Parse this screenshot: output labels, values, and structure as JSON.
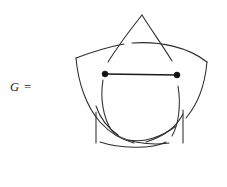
{
  "figure": {
    "label": "G =",
    "caption_text": "G =",
    "background_color": "#ffffff",
    "stroke_color": "#2b2b2b",
    "vertex_color": "#111111",
    "edge_color": "#1a1a1a",
    "width": 227,
    "height": 187
  },
  "diagram": {
    "type": "knot-graph",
    "star_points": [
      {
        "name": "top",
        "x": 142,
        "y": 15
      },
      {
        "name": "right",
        "x": 207,
        "y": 62
      },
      {
        "name": "bottom-right",
        "x": 183,
        "y": 143
      },
      {
        "name": "bottom-left",
        "x": 96,
        "y": 143
      },
      {
        "name": "left",
        "x": 76,
        "y": 58
      }
    ],
    "vertices": [
      {
        "id": "v1",
        "label": "",
        "x": 105,
        "y": 74
      },
      {
        "id": "v2",
        "label": "",
        "x": 177,
        "y": 75
      }
    ],
    "edges": [
      {
        "id": "e1",
        "from": "v1",
        "to": "v2",
        "style": "straight"
      }
    ],
    "strands": [
      {
        "id": "s1",
        "from": "top",
        "to": "bottom-right"
      },
      {
        "id": "s2",
        "from": "right",
        "to": "bottom-left"
      },
      {
        "id": "s3",
        "from": "bottom-right",
        "to": "left"
      },
      {
        "id": "s4",
        "from": "bottom-left",
        "to": "top"
      },
      {
        "id": "s5",
        "from": "left",
        "to": "right"
      }
    ],
    "crossing_count": 5,
    "vertex_count": 2,
    "edge_count": 1
  }
}
